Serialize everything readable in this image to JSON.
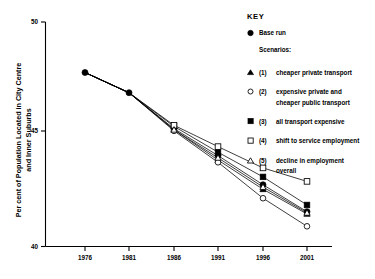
{
  "chart_data": {
    "type": "line",
    "title": "",
    "xlabel": "",
    "ylabel": "Per cent of Population Located in City Centre and Inner Suburbs",
    "ylabel_line1": "Per cent of Population Located in City Centre",
    "ylabel_line2": "and Inner Suburbs",
    "x": [
      "1976",
      "1981",
      "1986",
      "1991",
      "1996",
      "2001"
    ],
    "xlim": [
      1976,
      2001
    ],
    "ylim": [
      40,
      50
    ],
    "yticks": [
      "50",
      "45",
      "40"
    ],
    "ytick_values": [
      50,
      45,
      40
    ],
    "xticks": [
      "1976",
      "1981",
      "1986",
      "1991",
      "1996",
      "2001"
    ],
    "grid": false,
    "legend_position": "right",
    "series": [
      {
        "name": "Base run",
        "key": "base-run",
        "marker": "filled-circle",
        "values": [
          47.75,
          46.85,
          45.25,
          44.05,
          42.75,
          41.55
        ]
      },
      {
        "name": "(1) cheaper private transport",
        "key": "scenario-1",
        "marker": "filled-triangle",
        "values": [
          47.75,
          46.85,
          45.2,
          43.85,
          42.55,
          41.45
        ]
      },
      {
        "name": "(2) expensive private and cheaper public transport",
        "key": "scenario-2",
        "marker": "open-circle",
        "values": [
          47.75,
          46.85,
          45.15,
          43.75,
          42.15,
          40.9
        ]
      },
      {
        "name": "(3) all transport expensive",
        "key": "scenario-3",
        "marker": "filled-square",
        "values": [
          47.75,
          46.85,
          45.35,
          44.2,
          43.1,
          41.85
        ]
      },
      {
        "name": "(4) shift to service employment",
        "key": "scenario-4",
        "marker": "open-square",
        "values": [
          47.75,
          46.85,
          45.4,
          44.45,
          43.5,
          42.9
        ]
      },
      {
        "name": "(5) decline in employment overall",
        "key": "scenario-5",
        "marker": "open-triangle",
        "values": [
          47.75,
          46.85,
          45.2,
          43.95,
          42.65,
          41.5
        ]
      }
    ]
  },
  "legend": {
    "title": "KEY",
    "base_label": "Base run",
    "scenarios_label": "Scenarios:",
    "items": [
      {
        "marker": "filled-triangle",
        "number": "(1)",
        "line1": "cheaper private transport",
        "line2": ""
      },
      {
        "marker": "open-circle",
        "number": "(2)",
        "line1": "expensive private and",
        "line2": "cheaper public transport"
      },
      {
        "marker": "filled-square",
        "number": "(3)",
        "line1": "all transport expensive",
        "line2": ""
      },
      {
        "marker": "open-square",
        "number": "(4)",
        "line1": "shift to service employment",
        "line2": ""
      },
      {
        "marker": "open-triangle",
        "number": "(5)",
        "line1": "decline in employment",
        "line2": "overall"
      }
    ]
  },
  "colors": {
    "ink": "#000000",
    "background": "#ffffff"
  }
}
